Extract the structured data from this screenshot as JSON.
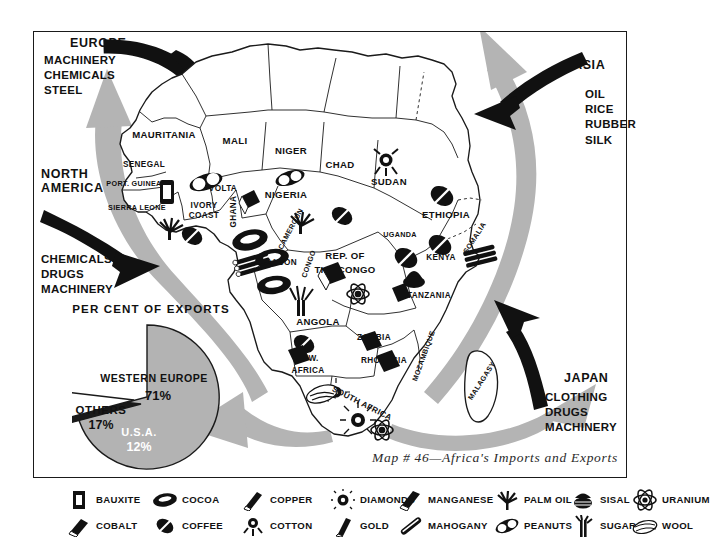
{
  "map": {
    "caption": "Map # 46—Africa's Imports and Exports",
    "title": "Africa's Imports and Exports"
  },
  "trade_partners": [
    {
      "id": "europe",
      "name": "EUROPE",
      "goods": [
        "MACHINERY",
        "CHEMICALS",
        "STEEL"
      ],
      "arrow": "black-inbound"
    },
    {
      "id": "north-america",
      "name": "NORTH\nAMERICA",
      "name_lines": [
        "NORTH",
        "AMERICA"
      ],
      "goods": [
        "CHEMICALS",
        "DRUGS",
        "MACHINERY"
      ],
      "arrow": "black-inbound"
    },
    {
      "id": "asia",
      "name": "ASIA",
      "goods": [
        "OIL",
        "RICE",
        "RUBBER",
        "SILK"
      ],
      "arrow": "black-inbound"
    },
    {
      "id": "japan",
      "name": "JAPAN",
      "goods": [
        "CLOTHING",
        "DRUGS",
        "MACHINERY"
      ],
      "arrow": "black-inbound"
    }
  ],
  "chart_data": {
    "type": "pie",
    "title": "PER CENT OF EXPORTS",
    "categories": [
      "WESTERN EUROPE",
      "OTHERS",
      "U.S.A."
    ],
    "values": [
      71,
      17,
      12
    ],
    "labels": [
      "71%",
      "17%",
      "12%"
    ],
    "colors": [
      "#b3b3b3",
      "#ffffff",
      "#1a1a1a"
    ],
    "unit": "percent",
    "legend": "inside-slices",
    "grid": false
  },
  "countries": [
    {
      "name": "MAURITANIA",
      "x": 164,
      "y": 136,
      "size": "md"
    },
    {
      "name": "MALI",
      "x": 235,
      "y": 142,
      "size": "md"
    },
    {
      "name": "NIGER",
      "x": 291,
      "y": 152,
      "size": "md"
    },
    {
      "name": "CHAD",
      "x": 340,
      "y": 166,
      "size": "md"
    },
    {
      "name": "SUDAN",
      "x": 389,
      "y": 183,
      "size": "md"
    },
    {
      "name": "SENEGAL",
      "x": 144,
      "y": 166,
      "size": "sm"
    },
    {
      "name": "PORT. GUINEA",
      "x": 134,
      "y": 186,
      "size": "xs"
    },
    {
      "name": "SIERRA LEONE",
      "x": 137,
      "y": 210,
      "size": "xs"
    },
    {
      "name": "VOLTA",
      "x": 223,
      "y": 190,
      "size": "sm"
    },
    {
      "name": "IVORY",
      "x": 204,
      "y": 207,
      "size": "sm"
    },
    {
      "name": "COAST",
      "x": 204,
      "y": 217,
      "size": "sm"
    },
    {
      "name": "GHANA",
      "x": 234,
      "y": 213,
      "size": "sm",
      "rot": "rot-90"
    },
    {
      "name": "NIGERIA",
      "x": 286,
      "y": 196,
      "size": "md"
    },
    {
      "name": "CAMEROUN",
      "x": 291,
      "y": 231,
      "size": "xs",
      "rot": "rot-60"
    },
    {
      "name": "GABON",
      "x": 281,
      "y": 264,
      "size": "sm"
    },
    {
      "name": "CONGO",
      "x": 309,
      "y": 266,
      "size": "xs",
      "rot": "rot-70"
    },
    {
      "name": "REP. OF",
      "x": 345,
      "y": 257,
      "size": "md"
    },
    {
      "name": "THE CONGO",
      "x": 345,
      "y": 271,
      "size": "md"
    },
    {
      "name": "ETHIOPIA",
      "x": 446,
      "y": 216,
      "size": "md"
    },
    {
      "name": "UGANDA",
      "x": 400,
      "y": 237,
      "size": "xs"
    },
    {
      "name": "KENYA",
      "x": 441,
      "y": 259,
      "size": "sm"
    },
    {
      "name": "SOMALIA",
      "x": 475,
      "y": 240,
      "size": "xs",
      "rot": "rot-55"
    },
    {
      "name": "TANZANIA",
      "x": 429,
      "y": 297,
      "size": "sm"
    },
    {
      "name": "ANGOLA",
      "x": 318,
      "y": 323,
      "size": "md"
    },
    {
      "name": "ZAMBIA",
      "x": 374,
      "y": 339,
      "size": "sm"
    },
    {
      "name": "RHODESIA",
      "x": 384,
      "y": 362,
      "size": "sm"
    },
    {
      "name": "MOZAMBIQUE",
      "x": 424,
      "y": 358,
      "size": "xs",
      "rot": "rot-70"
    },
    {
      "name": "S. W.",
      "x": 308,
      "y": 360,
      "size": "sm"
    },
    {
      "name": "AFRICA",
      "x": 308,
      "y": 372,
      "size": "sm"
    },
    {
      "name": "SOUTH AFRICA",
      "x": 362,
      "y": 405,
      "size": "sm",
      "rot": "rot-p30"
    },
    {
      "name": "MALAGASY",
      "x": 482,
      "y": 383,
      "size": "xs",
      "rot": "rot-55"
    }
  ],
  "legend": {
    "title": "Commodity key",
    "columns": [
      {
        "left": 66,
        "items": [
          {
            "label": "BAUXITE",
            "icon": "bauxite-icon"
          },
          {
            "label": "COBALT",
            "icon": "cobalt-icon"
          }
        ]
      },
      {
        "left": 152,
        "items": [
          {
            "label": "COCOA",
            "icon": "cocoa-icon"
          },
          {
            "label": "COFFEE",
            "icon": "coffee-icon"
          }
        ]
      },
      {
        "left": 240,
        "items": [
          {
            "label": "COPPER",
            "icon": "copper-icon"
          },
          {
            "label": "COTTON",
            "icon": "cotton-icon"
          }
        ]
      },
      {
        "left": 330,
        "items": [
          {
            "label": "DIAMONDS",
            "icon": "diamonds-icon"
          },
          {
            "label": "GOLD",
            "icon": "gold-icon"
          }
        ]
      },
      {
        "left": 398,
        "items": [
          {
            "label": "MANGANESE",
            "icon": "manganese-icon"
          },
          {
            "label": "MAHOGANY",
            "icon": "mahogany-icon"
          }
        ]
      },
      {
        "left": 494,
        "items": [
          {
            "label": "PALM OIL",
            "icon": "palm-oil-icon"
          },
          {
            "label": "PEANUTS",
            "icon": "peanuts-icon"
          }
        ]
      },
      {
        "left": 570,
        "items": [
          {
            "label": "SISAL",
            "icon": "sisal-icon"
          },
          {
            "label": "SUGAR",
            "icon": "sugar-icon"
          }
        ]
      },
      {
        "left": 632,
        "items": [
          {
            "label": "URANIUM",
            "icon": "uranium-icon"
          },
          {
            "label": "WOOL",
            "icon": "wool-icon"
          }
        ]
      }
    ]
  },
  "colors": {
    "ink": "#1a1a1a",
    "gray_arrow": "#b4b4b4",
    "pie_main": "#b3b3b3",
    "paper": "#ffffff"
  }
}
